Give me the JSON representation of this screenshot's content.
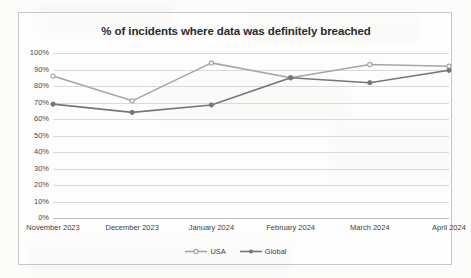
{
  "chart_data": {
    "type": "line",
    "title": "% of incidents where data was definitely breached",
    "xlabel": "",
    "ylabel": "",
    "categories": [
      "November 2023",
      "December 2023",
      "January 2024",
      "February 2024",
      "March 2024",
      "April 2024"
    ],
    "series": [
      {
        "name": "USA",
        "values": [
          86,
          71,
          94,
          85,
          93,
          92
        ],
        "color": "#a6a6a6",
        "marker": "open-circle"
      },
      {
        "name": "Global",
        "values": [
          69,
          64,
          68.5,
          85,
          82,
          89.5
        ],
        "color": "#767676",
        "marker": "filled-circle"
      }
    ],
    "ylim": [
      0,
      100
    ],
    "ytick_labels": [
      "100%",
      "90%",
      "80%",
      "70%",
      "60%",
      "50%",
      "40%",
      "30%",
      "20%",
      "10%",
      "0%"
    ],
    "ytick_values": [
      100,
      90,
      80,
      70,
      60,
      50,
      40,
      30,
      20,
      10,
      0
    ],
    "grid": true,
    "legend_position": "bottom"
  },
  "legend": {
    "items": [
      {
        "label": "USA"
      },
      {
        "label": "Global"
      }
    ]
  },
  "colors": {
    "usa": "#a6a6a6",
    "global": "#767676",
    "gridline": "#d9d9d9",
    "frame": "#c8c8c8",
    "text": "#3f3f3f"
  }
}
